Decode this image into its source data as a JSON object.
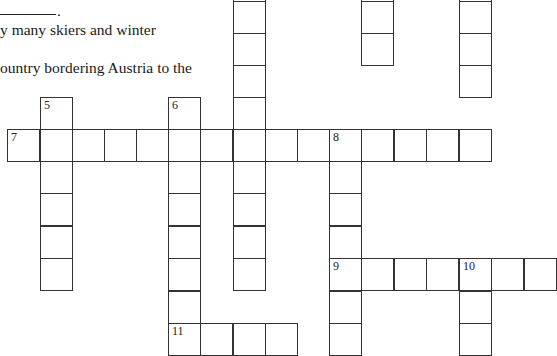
{
  "clues": {
    "fragment_blank_suffix": ".",
    "line1": "y many skiers and winter",
    "line2": "ountry bordering Austria to the"
  },
  "grid": {
    "cell_size": 32.4,
    "col_x": [
      7,
      40,
      72,
      104,
      136,
      168,
      200,
      233,
      265,
      297,
      329,
      361,
      394,
      426,
      459,
      491,
      524
    ],
    "cells": [
      {
        "c": 7,
        "y": -31
      },
      {
        "c": 7,
        "y": 1
      },
      {
        "c": 7,
        "y": 33
      },
      {
        "c": 7,
        "y": 65
      },
      {
        "c": 7,
        "y": 97
      },
      {
        "c": 7,
        "y": 161
      },
      {
        "c": 7,
        "y": 193
      },
      {
        "c": 7,
        "y": 226
      },
      {
        "c": 7,
        "y": 258
      },
      {
        "c": 11,
        "y": -31
      },
      {
        "c": 11,
        "y": 1
      },
      {
        "c": 11,
        "y": 33
      },
      {
        "c": 14,
        "y": -31
      },
      {
        "c": 14,
        "y": 1
      },
      {
        "c": 14,
        "y": 33
      },
      {
        "c": 14,
        "y": 65
      },
      {
        "c": 1,
        "y": 97,
        "n": "5"
      },
      {
        "c": 1,
        "y": 161
      },
      {
        "c": 1,
        "y": 193
      },
      {
        "c": 1,
        "y": 226
      },
      {
        "c": 1,
        "y": 258
      },
      {
        "c": 5,
        "y": 97,
        "n": "6"
      },
      {
        "c": 5,
        "y": 161
      },
      {
        "c": 5,
        "y": 193
      },
      {
        "c": 5,
        "y": 226
      },
      {
        "c": 5,
        "y": 258
      },
      {
        "c": 5,
        "y": 291
      },
      {
        "c": 0,
        "y": 129,
        "n": "7"
      },
      {
        "c": 1,
        "y": 129
      },
      {
        "c": 2,
        "y": 129
      },
      {
        "c": 3,
        "y": 129
      },
      {
        "c": 4,
        "y": 129
      },
      {
        "c": 5,
        "y": 129
      },
      {
        "c": 6,
        "y": 129
      },
      {
        "c": 7,
        "y": 129
      },
      {
        "c": 8,
        "y": 129
      },
      {
        "c": 9,
        "y": 129
      },
      {
        "c": 10,
        "y": 129,
        "n": "8"
      },
      {
        "c": 11,
        "y": 129
      },
      {
        "c": 12,
        "y": 129
      },
      {
        "c": 13,
        "y": 129
      },
      {
        "c": 14,
        "y": 129
      },
      {
        "c": 10,
        "y": 161
      },
      {
        "c": 10,
        "y": 193
      },
      {
        "c": 10,
        "y": 226
      },
      {
        "c": 10,
        "y": 291
      },
      {
        "c": 10,
        "y": 323
      },
      {
        "c": 10,
        "y": 258,
        "n": "9"
      },
      {
        "c": 11,
        "y": 258
      },
      {
        "c": 12,
        "y": 258
      },
      {
        "c": 13,
        "y": 258
      },
      {
        "c": 14,
        "y": 258,
        "n": "10"
      },
      {
        "c": 15,
        "y": 258
      },
      {
        "c": 16,
        "y": 258
      },
      {
        "c": 14,
        "y": 291
      },
      {
        "c": 14,
        "y": 323
      },
      {
        "c": 5,
        "y": 323,
        "n": "11"
      },
      {
        "c": 6,
        "y": 323
      },
      {
        "c": 7,
        "y": 323
      },
      {
        "c": 8,
        "y": 323
      }
    ]
  }
}
